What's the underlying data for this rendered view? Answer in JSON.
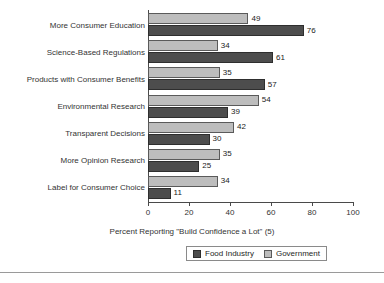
{
  "chart_data": {
    "type": "bar",
    "orientation": "horizontal",
    "title": "",
    "xlabel": "Percent Reporting \"Build Confidence a Lot\" (5)",
    "ylabel": "",
    "xlim": [
      0,
      100
    ],
    "xticks": [
      0,
      20,
      40,
      60,
      80,
      100
    ],
    "grid": false,
    "legend_position": "bottom",
    "categories": [
      "More Consumer Education",
      "Science-Based Regulations",
      "Products with Consumer Benefits",
      "Environmental Research",
      "Transparent Decisions",
      "More Opinion Research",
      "Label for Consumer Choice"
    ],
    "series": [
      {
        "name": "Food Industry",
        "color": "#4d4d4d",
        "values": [
          76,
          61,
          57,
          39,
          30,
          25,
          11
        ]
      },
      {
        "name": "Government",
        "color": "#bdbdbd",
        "values": [
          49,
          34,
          35,
          54,
          42,
          35,
          34
        ]
      }
    ]
  },
  "axis": {
    "tick_labels": [
      "0",
      "20",
      "40",
      "60",
      "80",
      "100"
    ],
    "title": "Percent Reporting \"Build Confidence a Lot\" (5)"
  },
  "legend": {
    "items": [
      {
        "label": "Food Industry",
        "swatch": "dark"
      },
      {
        "label": "Government",
        "swatch": "light"
      }
    ]
  }
}
